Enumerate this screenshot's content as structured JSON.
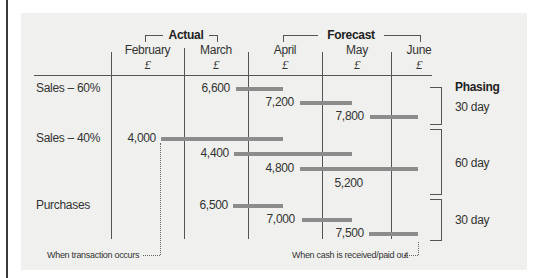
{
  "header": {
    "group_actual": "Actual",
    "group_forecast": "Forecast",
    "columns": [
      {
        "month": "February",
        "currency": "£"
      },
      {
        "month": "March",
        "currency": "£"
      },
      {
        "month": "April",
        "currency": "£"
      },
      {
        "month": "May",
        "currency": "£"
      },
      {
        "month": "June",
        "currency": "£"
      }
    ]
  },
  "rows": [
    {
      "label": "Sales – 60%"
    },
    {
      "label": "Sales – 40%"
    },
    {
      "label": "Purchases"
    }
  ],
  "values": {
    "s60_mar": "6,600",
    "s60_apr": "7,200",
    "s60_may": "7,800",
    "s40_feb": "4,000",
    "s40_mar": "4,400",
    "s40_apr": "4,800",
    "s40_may": "5,200",
    "pur_mar": "6,500",
    "pur_apr": "7,000",
    "pur_may": "7,500"
  },
  "phasing": {
    "title": "Phasing",
    "groups": [
      "30 day",
      "60 day",
      "30 day"
    ]
  },
  "notes": {
    "transaction": "When transaction occurs",
    "cash": "When cash is received/paid out"
  },
  "colors": {
    "panel_bg": "#f0f0ee",
    "bar": "#8c8c8c",
    "line": "#555555"
  }
}
